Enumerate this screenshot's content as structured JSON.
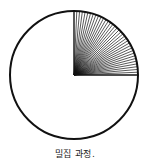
{
  "figure": {
    "caption": "밀집 과정.",
    "circle": {
      "cx": 74,
      "cy": 75,
      "r": 64,
      "stroke": "#111111",
      "stroke_width": 2
    },
    "rays": {
      "count": 36,
      "start_deg": 0,
      "end_deg": 90,
      "color": "#111111",
      "stroke_width": 0.7
    }
  }
}
